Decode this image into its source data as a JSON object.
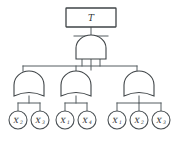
{
  "diagram": {
    "type": "fault-tree",
    "top_event": {
      "label": "T",
      "shape": "rectangle"
    },
    "gates": [
      {
        "id": "and-1",
        "type": "AND",
        "inputs": 3
      },
      {
        "id": "or-left",
        "type": "OR",
        "inputs": 2
      },
      {
        "id": "or-middle",
        "type": "OR",
        "inputs": 2
      },
      {
        "id": "or-right",
        "type": "OR",
        "inputs": 3
      }
    ],
    "basic_events": [
      {
        "id": "leaf-1",
        "label": "X",
        "subscript": "2",
        "group": "or-left"
      },
      {
        "id": "leaf-2",
        "label": "X",
        "subscript": "3",
        "group": "or-left"
      },
      {
        "id": "leaf-3",
        "label": "X",
        "subscript": "1",
        "group": "or-middle"
      },
      {
        "id": "leaf-4",
        "label": "X",
        "subscript": "4",
        "group": "or-middle"
      },
      {
        "id": "leaf-5",
        "label": "X",
        "subscript": "1",
        "group": "or-right"
      },
      {
        "id": "leaf-6",
        "label": "X",
        "subscript": "2",
        "group": "or-right"
      },
      {
        "id": "leaf-7",
        "label": "X",
        "subscript": "3",
        "group": "or-right"
      }
    ],
    "colors": {
      "background": "#ffffff",
      "outline": "#3f4447",
      "wire": "#555c60",
      "text": "#2b2f31"
    }
  }
}
